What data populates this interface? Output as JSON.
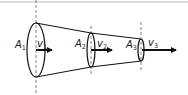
{
  "diagram": {
    "type": "fluid-flow-tapered-pipe",
    "colors": {
      "stroke": "#111111",
      "top_rule": "#bbbbbb",
      "dash": "#666666"
    },
    "sections": [
      {
        "area_label": "A",
        "area_sub": "1",
        "velocity_label": "v",
        "velocity_sub": "1"
      },
      {
        "area_label": "A",
        "area_sub": "2",
        "velocity_label": "v",
        "velocity_sub": "2"
      },
      {
        "area_label": "A",
        "area_sub": "3",
        "velocity_label": "v",
        "velocity_sub": "3"
      }
    ]
  }
}
